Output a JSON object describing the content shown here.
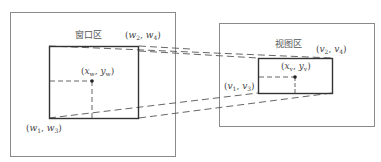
{
  "diagram": {
    "type": "window-to-viewport mapping",
    "colors": {
      "outer_border": "#8a8a8a",
      "inner_border": "#333333",
      "dashed": "#555555",
      "text": "#444444",
      "background": "#ffffff"
    },
    "window_area": {
      "title": "窗口区",
      "corner_top_right": {
        "var": "w",
        "i": "2",
        "j": "4"
      },
      "corner_bottom_left": {
        "var": "w",
        "i": "1",
        "j": "3"
      },
      "point": {
        "x": "x",
        "xs": "w",
        "y": "y",
        "ys": "w"
      }
    },
    "viewport_area": {
      "title": "视图区",
      "corner_top_right": {
        "var": "v",
        "i": "2",
        "j": "4"
      },
      "corner_bottom_left": {
        "var": "v",
        "i": "1",
        "j": "3"
      },
      "point": {
        "x": "x",
        "xs": "v",
        "y": "y",
        "ys": "v"
      }
    }
  }
}
